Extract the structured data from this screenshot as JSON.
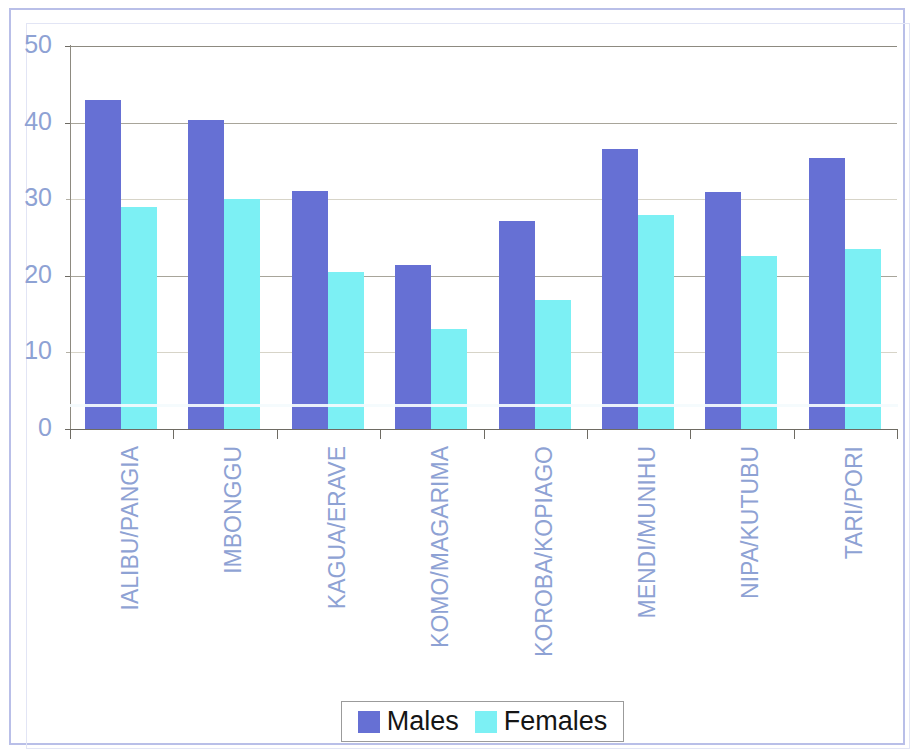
{
  "chart_data": {
    "type": "bar",
    "title": "",
    "subtitle": "",
    "xlabel": "",
    "ylabel": "",
    "grid": true,
    "legend_position": "bottom",
    "ylim": [
      0,
      50
    ],
    "yticks": [
      0,
      10,
      20,
      30,
      40,
      50
    ],
    "ytick_labels": [
      "0",
      "10",
      "20",
      "30",
      "40",
      "50"
    ],
    "categories": [
      "IALIBU/PANGIA",
      "IMBONGGU",
      "KAGUA/ERAVE",
      "KOMO/MAGARIMA",
      "KOROBA/KOPIAGO",
      "MENDI/MUNIHU",
      "NIPA/KUTUBU",
      "TARI/PORI"
    ],
    "series": [
      {
        "name": "Males",
        "color": "#6670d4",
        "values": [
          43.0,
          40.3,
          31.1,
          21.4,
          27.1,
          36.6,
          31.0,
          35.4
        ]
      },
      {
        "name": "Females",
        "color": "#7cf0f4",
        "values": [
          29.0,
          30.0,
          20.5,
          13.0,
          16.8,
          28.0,
          22.6,
          23.5
        ]
      }
    ]
  },
  "legend": {
    "items": [
      {
        "label": "Males",
        "color": "#6670d4"
      },
      {
        "label": "Females",
        "color": "#7cf0f4"
      }
    ]
  },
  "axis": {
    "tick_color": "#8ea2d4",
    "line_color": "#6e6b63"
  }
}
